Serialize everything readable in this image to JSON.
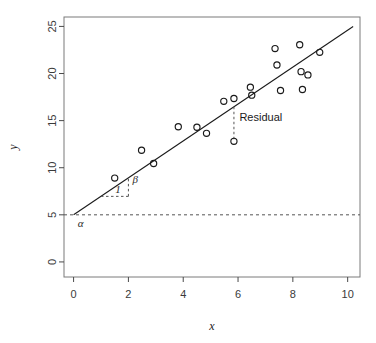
{
  "chart_data": {
    "type": "scatter",
    "title": "",
    "subtitle": "",
    "xlabel": "x",
    "ylabel": "y",
    "xlim": [
      -0.35,
      10.45
    ],
    "ylim": [
      -1.6,
      26.0
    ],
    "grid": false,
    "legend": null,
    "xticks": [
      0,
      2,
      4,
      6,
      8,
      10
    ],
    "xtick_labels": [
      "0",
      "2",
      "4",
      "6",
      "8",
      "10"
    ],
    "yticks": [
      0,
      5,
      10,
      15,
      20,
      25
    ],
    "ytick_labels": [
      "0",
      "5",
      "10",
      "15",
      "20",
      "25"
    ],
    "points": [
      {
        "x": 1.5,
        "y": 8.9
      },
      {
        "x": 2.48,
        "y": 11.85
      },
      {
        "x": 2.92,
        "y": 10.45
      },
      {
        "x": 3.82,
        "y": 14.35
      },
      {
        "x": 4.5,
        "y": 14.3
      },
      {
        "x": 4.85,
        "y": 13.65
      },
      {
        "x": 5.48,
        "y": 17.05
      },
      {
        "x": 5.85,
        "y": 17.35
      },
      {
        "x": 5.85,
        "y": 12.8
      },
      {
        "x": 6.45,
        "y": 18.55
      },
      {
        "x": 6.5,
        "y": 17.7
      },
      {
        "x": 7.35,
        "y": 22.65
      },
      {
        "x": 7.42,
        "y": 20.9
      },
      {
        "x": 7.55,
        "y": 18.2
      },
      {
        "x": 8.25,
        "y": 23.05
      },
      {
        "x": 8.3,
        "y": 20.2
      },
      {
        "x": 8.35,
        "y": 18.3
      },
      {
        "x": 8.55,
        "y": 19.85
      },
      {
        "x": 8.98,
        "y": 22.25
      }
    ],
    "series": [
      {
        "name": "observations",
        "type": "scatter",
        "marker": "open-circle",
        "color": "#1a1a1a",
        "x": [
          1.5,
          2.48,
          2.92,
          3.82,
          4.5,
          4.85,
          5.48,
          5.85,
          5.85,
          6.45,
          6.5,
          7.35,
          7.42,
          7.55,
          8.25,
          8.3,
          8.35,
          8.55,
          8.98
        ],
        "y": [
          8.9,
          11.85,
          10.45,
          14.35,
          14.3,
          13.65,
          17.05,
          17.35,
          12.8,
          18.55,
          17.7,
          22.65,
          20.9,
          18.2,
          23.05,
          20.2,
          18.3,
          19.85,
          22.25
        ]
      },
      {
        "name": "regression-line",
        "type": "line",
        "color": "#1a1a1a",
        "intercept": 5.0,
        "slope": 1.96,
        "x_start": 0.0,
        "y_start": 5.0,
        "x_end": 10.2,
        "y_end": 25.0
      },
      {
        "name": "intercept-reference-line",
        "type": "hline",
        "style": "dashed",
        "color": "#555555",
        "y": 5.0
      }
    ],
    "annotations": [
      {
        "name": "alpha",
        "label": "α",
        "x": 0.15,
        "y": 4.0,
        "note": "intercept marker below dashed line at y = 5"
      },
      {
        "name": "run-one",
        "label": "1",
        "x": 1.52,
        "y": 7.6,
        "note": "horizontal dashed run of length 1 from x=1 to x=2 at y=6.96"
      },
      {
        "name": "beta",
        "label": "β",
        "x": 2.15,
        "y": 8.6,
        "note": "vertical dashed rise from y=6.96 to y=8.92 at x=2"
      },
      {
        "name": "residual",
        "label": "Residual",
        "x": 6.05,
        "y": 15.3,
        "note": "vertical dashed drop from fitted line at (5.85, 16.47) to point (5.85, 12.80)"
      }
    ],
    "annotation_segments": [
      {
        "name": "run-segment",
        "x1": 1.0,
        "y1": 6.96,
        "x2": 2.0,
        "y2": 6.96,
        "style": "dashed"
      },
      {
        "name": "rise-segment",
        "x1": 2.0,
        "y1": 6.96,
        "x2": 2.0,
        "y2": 8.92,
        "style": "dashed"
      },
      {
        "name": "residual-segment",
        "x1": 5.85,
        "y1": 16.47,
        "x2": 5.85,
        "y2": 12.8,
        "style": "dashed"
      }
    ]
  },
  "figure": {
    "frame_visible": true,
    "background": "#ffffff",
    "foreground": "#1a1a1a"
  }
}
